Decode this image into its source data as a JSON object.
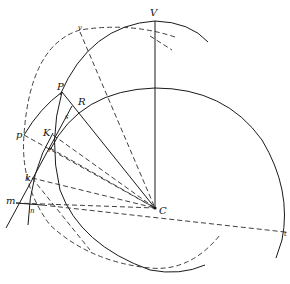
{
  "figure": {
    "type": "geometric-construction",
    "labels": {
      "V": "V",
      "v": "v",
      "P": "P",
      "R": "R",
      "p": "p",
      "K": "K",
      "s": "s",
      "r": "r",
      "k": "k",
      "m": "m",
      "n": "n",
      "C": "C",
      "t": "t"
    },
    "colors": {
      "ink": "#1a1a1a",
      "background": "#ffffff"
    }
  }
}
